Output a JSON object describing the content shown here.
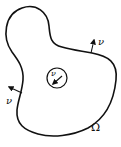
{
  "figure": {
    "domain_label": "Ω",
    "normal_labels": [
      "ν",
      "ν",
      "ν"
    ],
    "stroke_color": "#111111",
    "background": "#ffffff"
  },
  "labels": {
    "omega": "Ω",
    "nu_top_right": "ν",
    "nu_left": "ν",
    "nu_hole": "ν"
  }
}
